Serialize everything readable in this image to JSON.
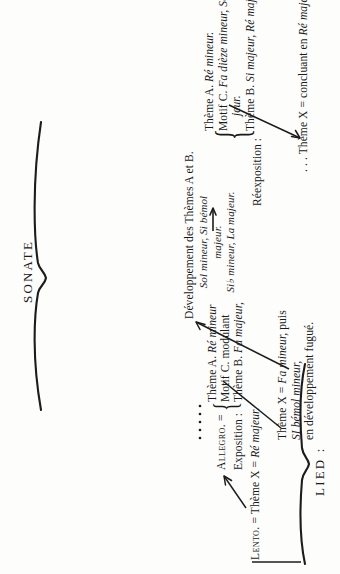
{
  "plate": {
    "background_color": "#fdfdfc",
    "ink_color": "#1c1c1c",
    "orientation": "rotated-90-ccw"
  },
  "braces": {
    "sonate_label": "SONATE",
    "lied_label": "LIED :"
  },
  "sections": {
    "lento": {
      "label": "Lento.",
      "equals_1": " = ",
      "theme": "Thème X",
      "equals_2": " = ",
      "key": "Ré majeur."
    },
    "allegro": {
      "label": "Allegro.",
      "equals": " = ",
      "dots": "• • • • •",
      "exposition_label": "Exposition :",
      "brace": "{",
      "exposition_lines": [
        {
          "plain": "Thème A. ",
          "italic": "Ré mineur"
        },
        {
          "plain": "Motif  C. modulant",
          "italic": ""
        },
        {
          "plain": "Thème B. ",
          "italic": "Fa majeur,"
        }
      ]
    },
    "theme_x_fugue": {
      "line1_plain": "Thème X = ",
      "line1_italic": "Fa mineur,",
      "line1_tail": " puis",
      "line2_italic": "SI bémol mineur,",
      "line3_plain": "en développement fugué."
    },
    "developpement": {
      "heading": "Développement des Thèmes A et B.",
      "keys": [
        "Sol mineur, Si bémol",
        "majeur.",
        "Si♭ mineur, La majeur."
      ]
    },
    "reexposition": {
      "label": "Réexposition :",
      "brace": "{",
      "lines": [
        {
          "plain": "Thème A. ",
          "italic": "Ré mineur."
        },
        {
          "plain": "Motif C. ",
          "italic": "Fa dièze mineur, Sol ma-"
        },
        {
          "plain": "",
          "italic": "jeur.",
          "indent": true
        },
        {
          "plain": "Thème B. ",
          "italic": "Si majeur, Ré majeur."
        }
      ]
    },
    "theme_x_final": {
      "leading_dots": ". . . ",
      "plain": "Thème X = concluant en ",
      "italic": "Ré majeur."
    }
  }
}
